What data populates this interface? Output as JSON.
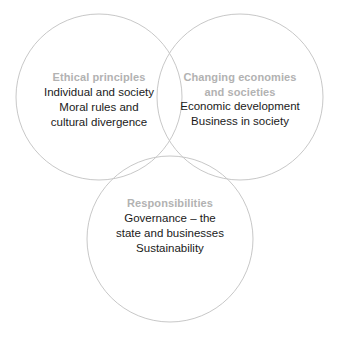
{
  "diagram": {
    "type": "venn",
    "circle_count": 3,
    "background_color": "#ffffff",
    "stroke_color": "#c8c8c8",
    "heading_color": "#b2b2b2",
    "body_color": "#1a1a1a",
    "circles": [
      {
        "id": "ethical-principles",
        "cx": 99,
        "cy": 97,
        "r": 83,
        "heading": "Ethical principles",
        "body": "Individual and society\nMoral rules and\ncultural divergence",
        "body_lines": [
          "Individual and society",
          "Moral rules and",
          "cultural divergence"
        ]
      },
      {
        "id": "changing-economies-and-societies",
        "cx": 240,
        "cy": 97,
        "r": 83,
        "heading": "Changing economies\nand societies",
        "heading_lines": [
          "Changing economies",
          "and societies"
        ],
        "body": "Economic development\nBusiness in society",
        "body_lines": [
          "Economic development",
          "Business in society"
        ]
      },
      {
        "id": "responsibilities",
        "cx": 170,
        "cy": 239,
        "r": 83,
        "heading": "Responsibilities",
        "body": "Governance – the\nstate and businesses\nSustainability",
        "body_lines": [
          "Governance – the",
          "state and businesses",
          "Sustainability"
        ]
      }
    ]
  }
}
